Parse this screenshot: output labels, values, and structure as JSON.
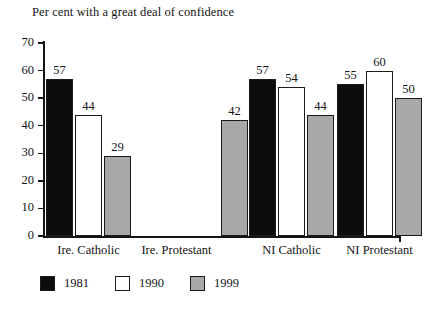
{
  "chart_data": {
    "type": "bar",
    "title": "Per cent with a great deal of confidence",
    "xlabel": "",
    "ylabel": "",
    "ylim": [
      0,
      70
    ],
    "yticks": [
      0,
      10,
      20,
      30,
      40,
      50,
      60,
      70
    ],
    "grid": false,
    "legend_position": "bottom-left",
    "categories": [
      "Ire. Catholic",
      "Ire. Protestant",
      "NI Catholic",
      "NI Protestant"
    ],
    "series": [
      {
        "name": "1981",
        "color": "#0d0d0d",
        "values": [
          57,
          null,
          57,
          55
        ]
      },
      {
        "name": "1990",
        "color": "#ffffff",
        "values": [
          44,
          null,
          54,
          60
        ]
      },
      {
        "name": "1999",
        "color": "#a8a8a8",
        "values": [
          29,
          42,
          44,
          50
        ]
      }
    ],
    "bars": [
      {
        "group": "Ire. Catholic",
        "series": "1981",
        "value": 57,
        "label": "57",
        "color_class": "c1981"
      },
      {
        "group": "Ire. Catholic",
        "series": "1990",
        "value": 44,
        "label": "44",
        "color_class": "c1990"
      },
      {
        "group": "Ire. Catholic",
        "series": "1999",
        "value": 29,
        "label": "29",
        "color_class": "c1999"
      },
      {
        "group": "Ire. Protestant",
        "series": "1999",
        "value": 42,
        "label": "42",
        "color_class": "c1999"
      },
      {
        "group": "NI Catholic",
        "series": "1981",
        "value": 57,
        "label": "57",
        "color_class": "c1981"
      },
      {
        "group": "NI Catholic",
        "series": "1990",
        "value": 54,
        "label": "54",
        "color_class": "c1990"
      },
      {
        "group": "NI Catholic",
        "series": "1999",
        "value": 44,
        "label": "44",
        "color_class": "c1999"
      },
      {
        "group": "NI Protestant",
        "series": "1981",
        "value": 55,
        "label": "55",
        "color_class": "c1981"
      },
      {
        "group": "NI Protestant",
        "series": "1990",
        "value": 60,
        "label": "60",
        "color_class": "c1990"
      },
      {
        "group": "NI Protestant",
        "series": "1999",
        "value": 50,
        "label": "50",
        "color_class": "c1999"
      }
    ]
  },
  "axis": {
    "y_tick_labels": [
      "70",
      "60",
      "50",
      "40",
      "30",
      "20",
      "10",
      "0"
    ]
  },
  "legend": {
    "items": [
      {
        "label": "1981",
        "color_class": "c1981"
      },
      {
        "label": "1990",
        "color_class": "c1990"
      },
      {
        "label": "1999",
        "color_class": "c1999"
      }
    ]
  },
  "layout": {
    "plot_left": 44,
    "plot_top": 43,
    "plot_width": 356,
    "plot_height": 193,
    "bar_width": 27,
    "bar_gap": 2,
    "group_gap": 14,
    "group_starts": [
      46,
      163,
      249,
      337
    ]
  }
}
